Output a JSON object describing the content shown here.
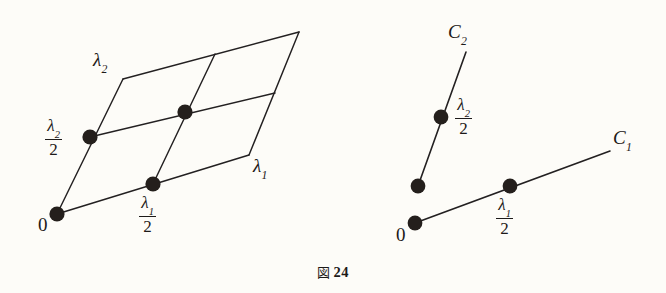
{
  "figure": {
    "caption_symbol": "図",
    "caption_number": "24",
    "background_color": "#fdfcf8",
    "ink_color": "#232021"
  },
  "left_panel": {
    "name": "lattice-parallelogram",
    "labels": {
      "origin": "0",
      "lambda1": {
        "var": "λ",
        "sub": "1"
      },
      "lambda2": {
        "var": "λ",
        "sub": "2"
      },
      "half_lambda1": {
        "num_var": "λ",
        "num_sub": "1",
        "den": "2"
      },
      "half_lambda2": {
        "num_var": "λ",
        "num_sub": "2",
        "den": "2"
      }
    },
    "vertices": {
      "origin": [
        57,
        214
      ],
      "lambda1": [
        249,
        155
      ],
      "lambda2": [
        123,
        79
      ],
      "opposite": [
        299,
        32
      ],
      "mid_lambda1": [
        153,
        184
      ],
      "mid_lambda2": [
        90,
        137
      ],
      "center": [
        185,
        112
      ],
      "mid_top_edge": [
        215,
        54
      ],
      "mid_right_edge": [
        275,
        93
      ]
    },
    "dot_points": [
      {
        "name": "origin-dot",
        "cx": 57,
        "cy": 214,
        "r": 7.6
      },
      {
        "name": "half-lambda2-dot",
        "cx": 90,
        "cy": 137,
        "r": 7.6
      },
      {
        "name": "half-lambda1-dot",
        "cx": 153,
        "cy": 184,
        "r": 7.6
      },
      {
        "name": "center-dot",
        "cx": 185,
        "cy": 112,
        "r": 7.6
      }
    ]
  },
  "right_panel": {
    "name": "two-rays",
    "labels": {
      "origin": "0",
      "c1": {
        "var": "C",
        "sub": "1"
      },
      "c2": {
        "var": "C",
        "sub": "2"
      },
      "half_lambda1": {
        "num_var": "λ",
        "num_sub": "1",
        "den": "2"
      },
      "half_lambda2": {
        "num_var": "λ",
        "num_sub": "2",
        "den": "2"
      }
    },
    "ray_c1": {
      "start": [
        415,
        223
      ],
      "end": [
        610,
        151
      ]
    },
    "ray_c2": {
      "start": [
        418,
        186
      ],
      "end": [
        466,
        52
      ]
    },
    "dot_points": [
      {
        "name": "c1-origin-dot",
        "cx": 415,
        "cy": 223,
        "r": 7.4
      },
      {
        "name": "c1-half-lambda1-dot",
        "cx": 510,
        "cy": 186,
        "r": 7.4
      },
      {
        "name": "c2-origin-dot",
        "cx": 418,
        "cy": 186,
        "r": 7.4
      },
      {
        "name": "c2-half-lambda2-dot",
        "cx": 441,
        "cy": 117,
        "r": 7.4
      }
    ]
  }
}
